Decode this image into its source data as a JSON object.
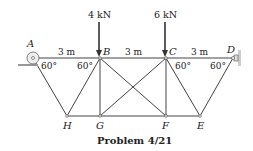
{
  "figure": {
    "caption": "Problem 4/21",
    "loads": [
      {
        "node": "B",
        "label": "4 kN"
      },
      {
        "node": "C",
        "label": "6 kN"
      }
    ],
    "nodes": {
      "A": {
        "label": "A",
        "x": 33,
        "y": 58
      },
      "B": {
        "label": "B",
        "x": 100,
        "y": 58
      },
      "C": {
        "label": "C",
        "x": 166,
        "y": 58
      },
      "D": {
        "label": "D",
        "x": 233,
        "y": 58
      },
      "E": {
        "label": "E",
        "x": 200,
        "y": 116
      },
      "F": {
        "label": "F",
        "x": 166,
        "y": 116
      },
      "G": {
        "label": "G",
        "x": 100,
        "y": 116
      },
      "H": {
        "label": "H",
        "x": 67,
        "y": 116
      }
    },
    "dimensions": [
      "3 m",
      "3 m",
      "3 m"
    ],
    "angles": [
      "60°",
      "60°",
      "60°",
      "60°"
    ],
    "members": [
      "AB",
      "BC",
      "CD",
      "AH",
      "HB",
      "BG",
      "BF",
      "GC",
      "CF",
      "CE",
      "ED",
      "HG",
      "GF",
      "FE"
    ]
  }
}
